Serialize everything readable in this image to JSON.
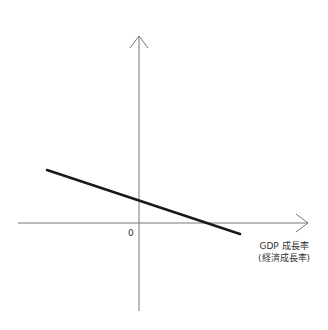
{
  "diagram": {
    "origin_label": "0",
    "x_axis_label_line1": "GDP 成長率",
    "x_axis_label_line2": "(経済成長率)",
    "y_axis_label": "",
    "line": {
      "description": "downward-sloping line",
      "y_intercept_sign": "positive",
      "x_intercept_sign": "positive",
      "slope_sign": "negative"
    },
    "colors": {
      "axis": "#777777",
      "line": "#1a1a1a",
      "text": "#333333"
    }
  }
}
